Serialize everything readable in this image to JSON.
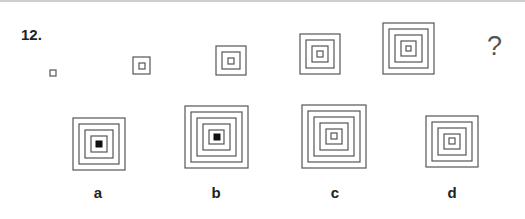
{
  "question": {
    "number": "12.",
    "missing_mark": "?"
  },
  "sequence": [
    {
      "rings": 1,
      "filled_center": false
    },
    {
      "rings": 2,
      "filled_center": false
    },
    {
      "rings": 3,
      "filled_center": false
    },
    {
      "rings": 4,
      "filled_center": false
    },
    {
      "rings": 5,
      "filled_center": false
    }
  ],
  "options": [
    {
      "label": "a",
      "rings": 4,
      "filled_center": true
    },
    {
      "label": "b",
      "rings": 5,
      "filled_center": true
    },
    {
      "label": "c",
      "rings": 6,
      "filled_center": false
    },
    {
      "label": "d",
      "rings": 5,
      "filled_center": false
    }
  ],
  "colors": {
    "stroke": "#555555",
    "fill": "#111111"
  }
}
